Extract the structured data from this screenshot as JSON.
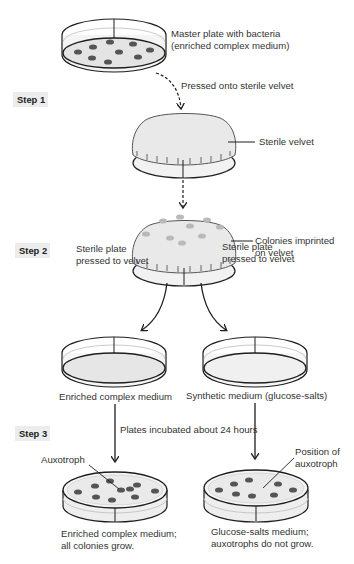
{
  "steps": [
    {
      "id": "step1",
      "label": "Step 1",
      "x": 14,
      "y": 93
    },
    {
      "id": "step2",
      "label": "Step 2",
      "x": 16,
      "y": 244
    },
    {
      "id": "step3",
      "label": "Step 3",
      "x": 16,
      "y": 427
    }
  ],
  "labels": {
    "master_plate_1": "Master plate with bacteria",
    "master_plate_2": "(enriched complex medium)",
    "pressed_onto_velvet": "Pressed onto sterile velvet",
    "sterile_velvet": "Sterile velvet",
    "colonies_imprinted_1": "Colonies imprinted",
    "colonies_imprinted_2": "on velvet",
    "sterile_plate_left_1": "Sterile plate",
    "sterile_plate_left_2": "pressed to velvet",
    "sterile_plate_right_1": "Sterile plate",
    "sterile_plate_right_2": "pressed to velvet",
    "enriched_medium": "Enriched complex medium",
    "synthetic_medium": "Synthetic medium (glucose-salts)",
    "incubated": "Plates incubated about 24 hours",
    "auxotroph": "Auxotroph",
    "position_of_auxotroph_1": "Position of",
    "position_of_auxotroph_2": "auxotroph",
    "result_left_1": "Enriched complex medium;",
    "result_left_2": "all colonies grow.",
    "result_right_1": "Glucose-salts medium;",
    "result_right_2": "auxotrophs do not grow."
  },
  "colors": {
    "outline": "#1e1e1e",
    "colony_dark": "#555555",
    "colony_light": "#b9b9b9",
    "medium_fill": "#e4e4e4",
    "velvet_fill": "#e9e9e9",
    "step_bg": "#ececec"
  },
  "diagram": {
    "master_plate_colonies": [
      [
        78,
        52
      ],
      [
        93,
        47
      ],
      [
        110,
        42
      ],
      [
        133,
        44
      ],
      [
        150,
        50
      ],
      [
        92,
        58
      ],
      [
        119,
        52
      ],
      [
        108,
        62
      ],
      [
        138,
        57
      ]
    ],
    "velvet_colonies": [
      [
        146,
        234
      ],
      [
        163,
        221
      ],
      [
        180,
        217
      ],
      [
        190,
        226
      ],
      [
        207,
        220
      ],
      [
        220,
        227
      ],
      [
        170,
        238
      ],
      [
        182,
        243
      ],
      [
        202,
        236
      ]
    ],
    "left_result_colonies": [
      [
        78,
        492
      ],
      [
        95,
        486
      ],
      [
        110,
        481
      ],
      [
        130,
        489
      ],
      [
        137,
        485
      ],
      [
        155,
        491
      ],
      [
        96,
        497
      ],
      [
        112,
        500
      ],
      [
        135,
        497
      ]
    ],
    "right_result_colonies": [
      [
        219,
        490
      ],
      [
        234,
        484
      ],
      [
        249,
        480
      ],
      [
        278,
        484
      ],
      [
        293,
        490
      ],
      [
        236,
        494
      ],
      [
        252,
        496
      ],
      [
        274,
        495
      ]
    ],
    "auxotroph_colony": [
      121,
      490
    ]
  }
}
